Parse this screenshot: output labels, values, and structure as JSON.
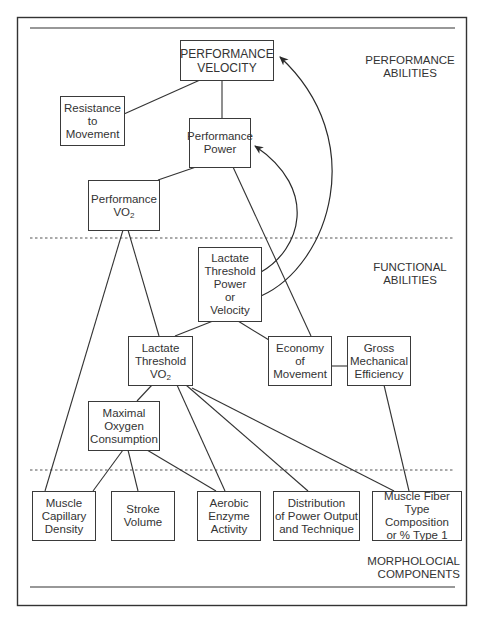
{
  "sections": {
    "performance": "PERFORMANCE\nABILITIES",
    "functional": "FUNCTIONAL\nABILITIES",
    "morphological": "MORPHOLOCIAL COMPONENTS"
  },
  "nodes": {
    "performance_velocity": "PERFORMANCE\nVELOCITY",
    "resistance_to_movement": "Resistance\nto\nMovement",
    "performance_power": "Performance\nPower",
    "performance_vo2_main": "Performance\nVO",
    "performance_vo2_sub": "2",
    "lactate_threshold_power": "Lactate\nThreshold\nPower\nor\nVelocity",
    "lactate_threshold_vo2_main": "Lactate\nThreshold\nVO",
    "lactate_threshold_vo2_sub": "2",
    "economy_of_movement": "Economy\nof\nMovement",
    "gross_mechanical_efficiency": "Gross\nMechanical\nEfficiency",
    "maximal_oxygen_consumption": "Maximal\nOxygen\nConsumption",
    "muscle_capillary_density": "Muscle\nCapillary\nDensity",
    "stroke_volume": "Stroke\nVolume",
    "aerobic_enzyme_activity": "Aerobic\nEnzyme\nActivity",
    "distribution_power_output": "Distribution\nof Power Output\nand Technique",
    "muscle_fiber_type": "Muscle Fiber Type\nComposition\nor % Type 1"
  },
  "edges": [
    [
      "performance_velocity",
      "resistance_to_movement"
    ],
    [
      "performance_velocity",
      "performance_power"
    ],
    [
      "performance_power",
      "performance_vo2"
    ],
    [
      "performance_power",
      "economy_of_movement"
    ],
    [
      "performance_vo2",
      "lactate_threshold_vo2"
    ],
    [
      "performance_vo2",
      "muscle_capillary_density"
    ],
    [
      "lactate_threshold_power",
      "lactate_threshold_vo2"
    ],
    [
      "lactate_threshold_power",
      "economy_of_movement"
    ],
    [
      "economy_of_movement",
      "gross_mechanical_efficiency"
    ],
    [
      "gross_mechanical_efficiency",
      "muscle_fiber_type"
    ],
    [
      "lactate_threshold_vo2",
      "maximal_oxygen_consumption"
    ],
    [
      "lactate_threshold_vo2",
      "aerobic_enzyme_activity"
    ],
    [
      "lactate_threshold_vo2",
      "distribution_power_output"
    ],
    [
      "lactate_threshold_vo2",
      "muscle_fiber_type"
    ],
    [
      "maximal_oxygen_consumption",
      "muscle_capillary_density"
    ],
    [
      "maximal_oxygen_consumption",
      "stroke_volume"
    ],
    [
      "maximal_oxygen_consumption",
      "aerobic_enzyme_activity"
    ]
  ],
  "arrows": [
    [
      "lactate_threshold_power",
      "performance_power"
    ],
    [
      "lactate_threshold_power",
      "performance_velocity"
    ]
  ]
}
